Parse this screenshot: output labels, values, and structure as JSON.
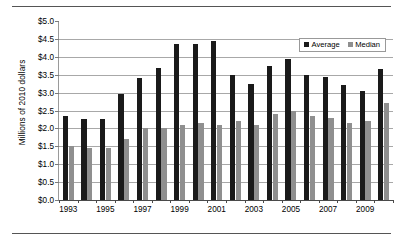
{
  "chart_data": {
    "type": "bar",
    "title": "",
    "xlabel": "",
    "ylabel": "Millions of 2010 dollars",
    "ylim": [
      0.0,
      5.0
    ],
    "ytick_labels": [
      "$5.0",
      "$4.5",
      "$4.0",
      "$3.5",
      "$3.0",
      "$2.5",
      "$2.0",
      "$1.5",
      "$1.0",
      "$0.5",
      "$0.0"
    ],
    "ytick_values": [
      5.0,
      4.5,
      4.0,
      3.5,
      3.0,
      2.5,
      2.0,
      1.5,
      1.0,
      0.5,
      0.0
    ],
    "grid": true,
    "legend_position": "top-right",
    "categories": [
      "1993",
      "1994",
      "1995",
      "1996",
      "1997",
      "1998",
      "1999",
      "2000",
      "2001",
      "2002",
      "2003",
      "2004",
      "2005",
      "2006",
      "2007",
      "2008",
      "2009",
      "2010"
    ],
    "xtick_labels_shown": [
      "1993",
      "1995",
      "1997",
      "1999",
      "2001",
      "2003",
      "2005",
      "2007",
      "2009"
    ],
    "series": [
      {
        "name": "Average",
        "color": "#1a1a1a",
        "values": [
          2.35,
          2.25,
          2.25,
          2.95,
          3.4,
          3.7,
          4.35,
          4.35,
          4.45,
          3.5,
          3.25,
          3.75,
          3.95,
          3.5,
          3.45,
          3.2,
          3.05,
          3.65
        ]
      },
      {
        "name": "Median",
        "color": "#8f8f8f",
        "values": [
          1.5,
          1.45,
          1.45,
          1.7,
          2.0,
          2.0,
          2.1,
          2.15,
          2.1,
          2.2,
          2.1,
          2.4,
          2.5,
          2.35,
          2.3,
          2.15,
          2.2,
          2.7
        ]
      }
    ]
  }
}
